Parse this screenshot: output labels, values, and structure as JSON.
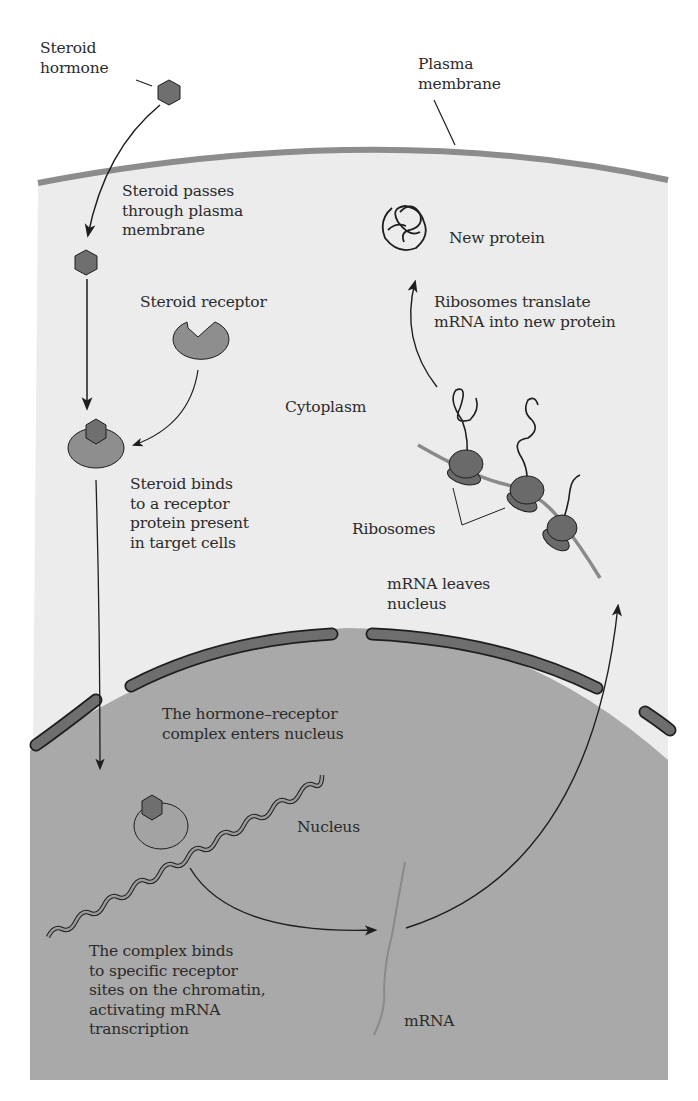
{
  "diagram": {
    "colors": {
      "background": "#ffffff",
      "cytoplasm": "#ececec",
      "plasma_membrane": "#8c8c8c",
      "nucleus": "#a9a9a9",
      "nuclear_envelope": "#6e6e6e",
      "steroid": "#6f6f6f",
      "receptor": "#8e8e8e",
      "ribosome": "#6a6a6a",
      "mrna": "#8a8a8a",
      "arrow": "#1e1e1e",
      "text": "#2b2b2b"
    },
    "labels": {
      "steroid_hormone": "Steroid\nhormone",
      "plasma_membrane": "Plasma\nmembrane",
      "steroid_passes": "Steroid passes\nthrough plasma\nmembrane",
      "new_protein": "New protein",
      "steroid_receptor": "Steroid receptor",
      "ribosomes_translate": "Ribosomes translate\nmRNA into new protein",
      "cytoplasm": "Cytoplasm",
      "steroid_binds": "Steroid binds\nto a receptor\nprotein present\nin target cells",
      "ribosomes": "Ribosomes",
      "mrna_leaves": "mRNA leaves\nnucleus",
      "complex_enters": "The hormone–receptor\ncomplex enters nucleus",
      "nucleus": "Nucleus",
      "complex_binds": "The complex binds\nto specific receptor\nsites on the chromatin,\nactivating mRNA\ntranscription",
      "mrna": "mRNA"
    },
    "steps": [
      "Steroid passes through plasma membrane",
      "Steroid binds to a receptor protein present in target cells",
      "The hormone–receptor complex enters nucleus",
      "The complex binds to specific receptor sites on the chromatin, activating mRNA transcription",
      "mRNA leaves nucleus",
      "Ribosomes translate mRNA into new protein"
    ]
  }
}
